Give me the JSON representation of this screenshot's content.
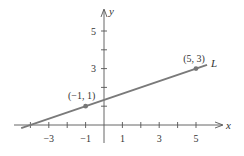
{
  "chart_data": {
    "type": "line",
    "title": "",
    "xlabel": "x",
    "ylabel": "y",
    "xlim": [
      -4.2,
      6.2
    ],
    "ylim": [
      -0.3,
      6.2
    ],
    "grid": false,
    "x_ticks": [
      -4,
      -3,
      -2,
      -1,
      0,
      1,
      2,
      3,
      4,
      5
    ],
    "x_tick_labels": [
      {
        "value": -3,
        "label": "−3"
      },
      {
        "value": -1,
        "label": "−1"
      },
      {
        "value": 1,
        "label": "1"
      },
      {
        "value": 3,
        "label": "3"
      },
      {
        "value": 5,
        "label": "5"
      }
    ],
    "y_ticks": [
      1,
      2,
      3,
      4,
      5
    ],
    "y_tick_labels": [
      {
        "value": 3,
        "label": "3"
      },
      {
        "value": 5,
        "label": "5"
      }
    ],
    "series": [
      {
        "name": "L",
        "label": "L",
        "slope": 0.3333,
        "intercept": 1.3333,
        "x_range": [
          -4.5,
          5.6
        ],
        "points": [
          {
            "x": -1,
            "y": 1,
            "label": "(−1, 1)"
          },
          {
            "x": 5,
            "y": 3,
            "label": "(5, 3)"
          }
        ]
      }
    ],
    "colors": {
      "line": "#7a7a7a",
      "axis": "#555555",
      "point": "#777777"
    }
  }
}
